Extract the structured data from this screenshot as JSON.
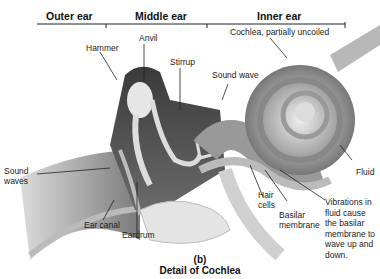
{
  "diagram": {
    "title": "Detail of Cochlea",
    "panel": "(b)",
    "sections": [
      "Outer ear",
      "Middle ear",
      "Inner ear"
    ],
    "labels": {
      "hammer": "Hammer",
      "anvil": "Anvil",
      "stirrup": "Stirrup",
      "cochlea": "Cochlea, partially uncoiled",
      "sound_wave": "Sound wave",
      "sound_waves_1": "Sound",
      "sound_waves_2": "waves",
      "ear_canal": "Ear canal",
      "eardrum": "Eardrum",
      "hair_cells_1": "Hair",
      "hair_cells_2": "cells",
      "basilar_1": "Basilar",
      "basilar_2": "membrane",
      "fluid": "Fluid",
      "vibrations": [
        "Vibrations in",
        "fluid cause",
        "the basilar",
        "membrane to",
        "wave up and",
        "down."
      ]
    },
    "colors": {
      "tissue_dark": "#4a4a4a",
      "tissue_mid": "#8a8a8a",
      "tissue_light": "#c8c8c8",
      "bone": "#e4e4e4",
      "background": "#ffffff"
    }
  }
}
